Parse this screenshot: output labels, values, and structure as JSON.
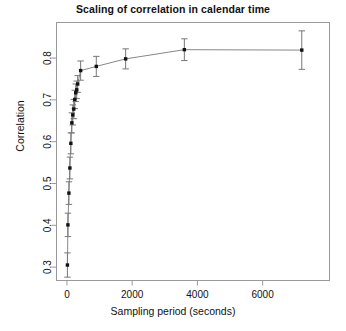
{
  "chart_data": {
    "type": "scatter",
    "title": "Scaling of correlation in calendar time",
    "xlabel": "Sampling period (seconds)",
    "ylabel": "Correlation",
    "grid": false,
    "legend": null,
    "xlim": [
      -320,
      8050
    ],
    "ylim": [
      0.268,
      0.885
    ],
    "xticks": [
      0,
      2000,
      4000,
      6000
    ],
    "xtick_labels": [
      "0",
      "2000",
      "4000",
      "6000"
    ],
    "yticks": [
      0.3,
      0.4,
      0.5,
      0.6,
      0.7,
      0.8
    ],
    "ytick_labels": [
      "0.3",
      "0.4",
      "0.5",
      "0.6",
      "0.7",
      "0.8"
    ],
    "marker": "filled-square",
    "errorbars": true,
    "x": [
      15,
      30,
      60,
      90,
      120,
      150,
      180,
      210,
      240,
      270,
      300,
      330,
      420,
      900,
      1800,
      3600,
      7200
    ],
    "y": [
      0.305,
      0.401,
      0.477,
      0.537,
      0.596,
      0.645,
      0.664,
      0.678,
      0.701,
      0.717,
      0.724,
      0.738,
      0.77,
      0.78,
      0.798,
      0.82,
      0.819
    ],
    "yerr_low": [
      0.029,
      0.028,
      0.027,
      0.026,
      0.025,
      0.024,
      0.024,
      0.023,
      0.022,
      0.021,
      0.021,
      0.02,
      0.023,
      0.024,
      0.024,
      0.026,
      0.046
    ],
    "yerr_high": [
      0.029,
      0.028,
      0.027,
      0.026,
      0.025,
      0.024,
      0.024,
      0.023,
      0.022,
      0.021,
      0.021,
      0.02,
      0.023,
      0.024,
      0.024,
      0.026,
      0.046
    ],
    "colors": {
      "marker": "#111111",
      "line": "#888888",
      "errorbar": "#777777",
      "axis": "#999999",
      "background": "#ffffff"
    }
  }
}
